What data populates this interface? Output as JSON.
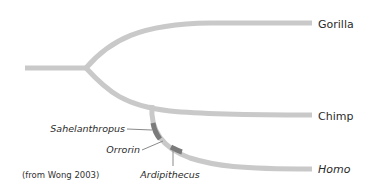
{
  "diagram": {
    "type": "phylogenetic-tree",
    "colors": {
      "branch": "#c9c9c9",
      "fossil_segment": "#7b7b7b",
      "leader_line": "#8a8a8a",
      "text": "#2b2b2b"
    },
    "taxa": [
      {
        "id": "gorilla",
        "label": "Gorilla",
        "italic": false
      },
      {
        "id": "chimp",
        "label": "Chimp",
        "italic": false
      },
      {
        "id": "homo",
        "label": "Homo",
        "italic": true
      }
    ],
    "fossils": [
      {
        "id": "sahelanthropus",
        "label": "Sahelanthropus",
        "on_branch": "homo"
      },
      {
        "id": "orrorin",
        "label": "Orrorin",
        "on_branch": "homo"
      },
      {
        "id": "ardipithecus",
        "label": "Ardipithecus",
        "on_branch": "homo"
      }
    ],
    "caption": "(from Wong 2003)"
  }
}
